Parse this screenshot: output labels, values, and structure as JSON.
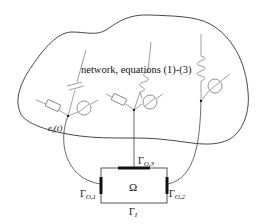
{
  "figure": {
    "network_label": "network, equations (1)-(3)",
    "source_label": {
      "base": "e",
      "sub": "i",
      "arg": "(t)"
    },
    "domain_label": "Ω",
    "boundaries": [
      {
        "id": "gamma-o1",
        "base": "Γ",
        "sub": "O,1",
        "position": "left"
      },
      {
        "id": "gamma-o2",
        "base": "Γ",
        "sub": "O,2",
        "position": "right"
      },
      {
        "id": "gamma-o3",
        "base": "Γ",
        "sub": "O,3",
        "position": "top"
      },
      {
        "id": "gamma-i",
        "base": "Γ",
        "sub": "I",
        "position": "bottom"
      }
    ],
    "components": [
      {
        "type": "resistor",
        "branch": 1
      },
      {
        "type": "capacitor",
        "branch": 1
      },
      {
        "type": "voltage-source",
        "branch": 1
      },
      {
        "type": "resistor",
        "branch": 2
      },
      {
        "type": "inductor",
        "branch": 2
      },
      {
        "type": "voltage-source",
        "branch": 2
      },
      {
        "type": "inductor",
        "branch": 3
      },
      {
        "type": "voltage-source",
        "branch": 3
      }
    ],
    "colors": {
      "outline": "#333333",
      "component": "#888888",
      "contact": "#111111",
      "background": "#ffffff"
    }
  }
}
